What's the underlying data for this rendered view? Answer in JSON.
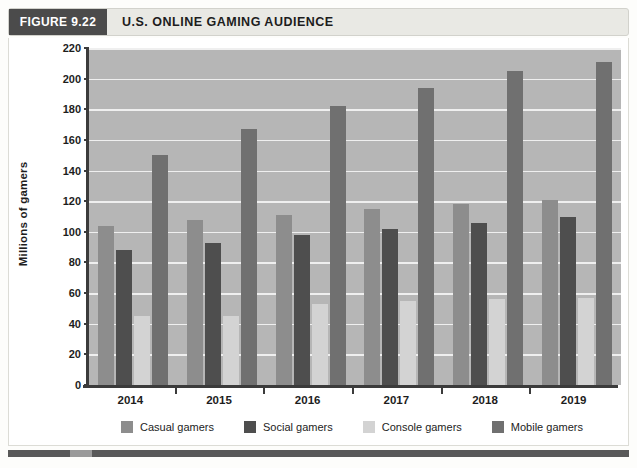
{
  "figure": {
    "number_label": "FIGURE 9.22",
    "title": "U.S. ONLINE GAMING AUDIENCE"
  },
  "chart_data": {
    "type": "bar",
    "title": "U.S. ONLINE GAMING AUDIENCE",
    "xlabel": "",
    "ylabel": "Millions of gamers",
    "categories": [
      "2014",
      "2015",
      "2016",
      "2017",
      "2018",
      "2019"
    ],
    "series": [
      {
        "name": "Casual gamers",
        "color": "#8d8d8d",
        "values": [
          104,
          108,
          111,
          115,
          118,
          121
        ]
      },
      {
        "name": "Social gamers",
        "color": "#4e4e4e",
        "values": [
          88,
          93,
          98,
          102,
          106,
          110
        ]
      },
      {
        "name": "Console gamers",
        "color": "#d3d3d3",
        "values": [
          45,
          45,
          53,
          55,
          56,
          57
        ]
      },
      {
        "name": "Mobile gamers",
        "color": "#707070",
        "values": [
          150,
          167,
          182,
          194,
          205,
          211
        ]
      }
    ],
    "ylim": [
      0,
      220
    ],
    "yticks": [
      0,
      20,
      40,
      60,
      80,
      100,
      120,
      140,
      160,
      180,
      200,
      220
    ],
    "ytick_labels": [
      "0",
      "20",
      "40",
      "60",
      "80",
      "100",
      "120",
      "140",
      "160",
      "180",
      "200",
      "220"
    ],
    "grid": true,
    "legend_position": "bottom",
    "plot_background": "#b6b6b6",
    "gridline_color": "#efefef"
  }
}
